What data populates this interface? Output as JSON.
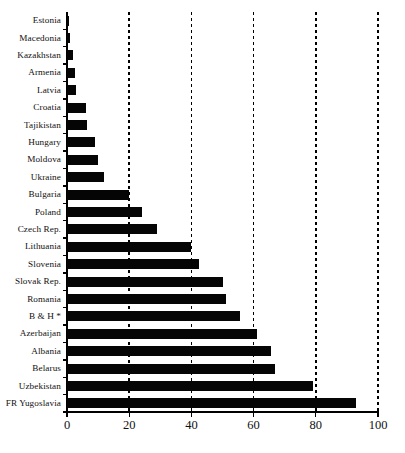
{
  "chart_data": {
    "type": "bar",
    "orientation": "horizontal",
    "title": "",
    "subtitle": "",
    "xlabel": "",
    "ylabel": "",
    "xlim": [
      0,
      100
    ],
    "xticks": [
      0,
      20,
      40,
      60,
      80,
      100
    ],
    "grid": "vertical dotted gridlines at each x tick",
    "legend": "none",
    "bar_color": "#050505",
    "axis_color": "#000000",
    "background": "#ffffff",
    "annotations": [
      "* in 'B & H *' denotes a footnote marker on Bosnia & Herzegovina"
    ],
    "categories": [
      "Estonia",
      "Macedonia",
      "Kazakhstan",
      "Armenia",
      "Latvia",
      "Croatia",
      "Tajikistan",
      "Hungary",
      "Moldova",
      "Ukraine",
      "Bulgaria",
      "Poland",
      "Czech Rep.",
      "Lithuania",
      "Slovenia",
      "Slovak Rep.",
      "Romania",
      "B & H *",
      "Azerbaijan",
      "Albania",
      "Belarus",
      "Uzbekistan",
      "FR Yugoslavia"
    ],
    "values": [
      0.5,
      1.0,
      2.0,
      2.5,
      3.0,
      6.0,
      6.5,
      9.0,
      10.0,
      12.0,
      20.0,
      24.0,
      29.0,
      40.0,
      42.5,
      50.0,
      51.0,
      55.5,
      61.0,
      65.5,
      67.0,
      79.0,
      93.0
    ]
  }
}
